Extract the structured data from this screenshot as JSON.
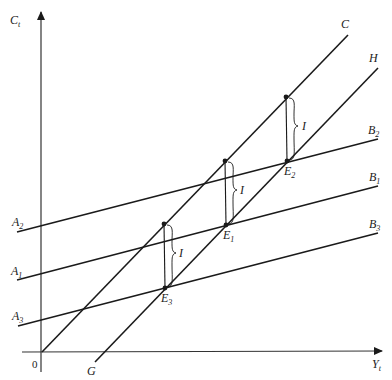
{
  "diagram": {
    "axes": {
      "y_label": {
        "main": "C",
        "sub": "t"
      },
      "x_label": {
        "main": "Y",
        "sub": "t"
      },
      "origin_label": "0"
    },
    "lines": {
      "C": {
        "label": "C"
      },
      "H": {
        "label": "H"
      },
      "G": {
        "label": "G"
      },
      "B2": {
        "main": "B",
        "sub": "2"
      },
      "B1": {
        "main": "B",
        "sub": "1"
      },
      "B3": {
        "main": "B",
        "sub": "3"
      },
      "A2": {
        "main": "A",
        "sub": "2"
      },
      "A1": {
        "main": "A",
        "sub": "1"
      },
      "A3": {
        "main": "A",
        "sub": "3"
      }
    },
    "equilibria": [
      {
        "main": "E",
        "sub": "2"
      },
      {
        "main": "E",
        "sub": "1"
      },
      {
        "main": "E",
        "sub": "3"
      }
    ],
    "gap_label": "I",
    "colors": {
      "ink": "#1a1a1a"
    }
  }
}
